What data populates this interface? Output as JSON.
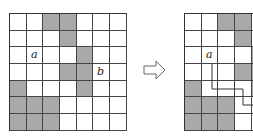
{
  "grid_size": 7,
  "shaded_cells": [
    [
      0,
      2
    ],
    [
      0,
      3
    ],
    [
      1,
      3
    ],
    [
      2,
      4
    ],
    [
      3,
      3
    ],
    [
      3,
      4
    ],
    [
      4,
      0
    ],
    [
      4,
      4
    ],
    [
      5,
      0
    ],
    [
      5,
      1
    ],
    [
      5,
      2
    ],
    [
      6,
      0
    ],
    [
      6,
      1
    ],
    [
      6,
      2
    ]
  ],
  "colors": {
    "shaded": "#a9a9a9",
    "line": "#444444"
  },
  "left_grid": {
    "labels": [
      {
        "text": "a",
        "row": 2,
        "col": 1
      },
      {
        "text": "b",
        "row": 3,
        "col": 5
      }
    ]
  },
  "right_grid": {
    "labels": [
      {
        "text": "a",
        "row": 2,
        "col": 1
      }
    ],
    "path": "a to b route"
  },
  "arrow": {
    "icon": "right-hollow-arrow-icon"
  }
}
